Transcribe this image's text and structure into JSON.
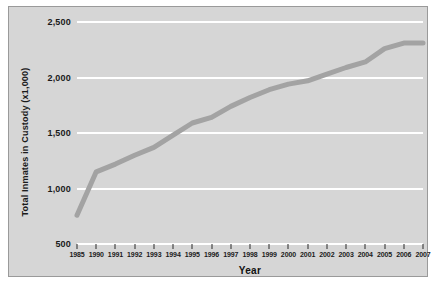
{
  "chart_data": {
    "type": "line",
    "title": "",
    "xlabel": "Year",
    "ylabel": "Total Inmates in Custody (x1,000)",
    "xlim": [
      1985,
      2007
    ],
    "ylim": [
      500,
      2500
    ],
    "yticks": [
      500,
      1000,
      1500,
      2000,
      2500
    ],
    "ytick_labels": [
      "500",
      "1,000",
      "1,500",
      "2,000",
      "2,500"
    ],
    "categories": [
      "1985",
      "1990",
      "1991",
      "1992",
      "1993",
      "1994",
      "1995",
      "1996",
      "1997",
      "1998",
      "1999",
      "2000",
      "2001",
      "2002",
      "2003",
      "2004",
      "2005",
      "2006",
      "2007"
    ],
    "values": [
      760,
      1150,
      1220,
      1300,
      1370,
      1480,
      1590,
      1640,
      1740,
      1820,
      1890,
      1940,
      1970,
      2030,
      2090,
      2140,
      2260,
      2310,
      2310
    ],
    "grid": true,
    "legend": false,
    "series_color": "#a3a3a3",
    "plot_background": "#d6d6d6",
    "gridline_color": "#ffffff"
  }
}
